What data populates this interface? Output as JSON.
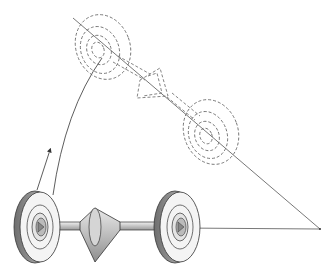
{
  "diagram": {
    "type": "technical-illustration",
    "components": [
      {
        "name": "left-wheel",
        "state": "solid"
      },
      {
        "name": "axle-shaft",
        "state": "solid"
      },
      {
        "name": "center-cone",
        "state": "solid"
      },
      {
        "name": "right-wheel",
        "state": "solid"
      },
      {
        "name": "rotated-upper-wheel",
        "state": "dashed"
      },
      {
        "name": "rotated-cone",
        "state": "dashed"
      },
      {
        "name": "rotated-lower-wheel",
        "state": "dashed"
      },
      {
        "name": "horizontal-axis-line",
        "state": "solid"
      },
      {
        "name": "rotated-axis-line",
        "state": "solid"
      },
      {
        "name": "rotation-arc",
        "state": "solid"
      },
      {
        "name": "rotation-arrow",
        "state": "solid"
      }
    ],
    "colors": {
      "line": "#333333",
      "wheel_fill": "#f2f2f2",
      "wheel_rim": "#8a8a8a",
      "dashed": "#666666"
    }
  }
}
